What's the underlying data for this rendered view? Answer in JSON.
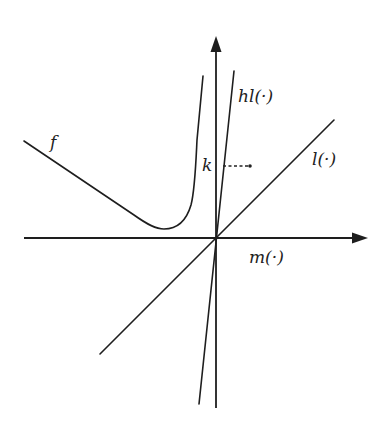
{
  "diagram": {
    "labels": {
      "f": "f",
      "hl": "hl(·)",
      "l": "l(·)",
      "m": "m(·)",
      "k": "k"
    },
    "colors": {
      "ink": "#1e1e1e",
      "background": "#ffffff"
    }
  }
}
